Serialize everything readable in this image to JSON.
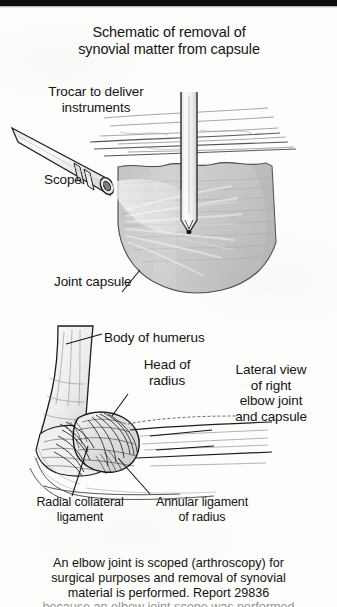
{
  "figure": {
    "title": "Schematic of removal of\nsynovial matter from capsule",
    "top_panel": {
      "labels": {
        "trocar": "Trocar to deliver\ninstruments",
        "scope": "Scope",
        "joint_capsule": "Joint capsule"
      }
    },
    "bottom_panel": {
      "labels": {
        "body_of_humerus": "Body of humerus",
        "head_of_radius": "Head of\nradius",
        "lateral_view": "Lateral view\nof right\nelbow joint\nand capsule",
        "radial_collateral_ligament": "Radial collateral\nligament",
        "annular_ligament": "Annular ligament\nof radius"
      }
    },
    "caption": "An elbow joint is scoped (arthroscopy) for\nsurgical purposes and removal of synovial\nmaterial is performed. Report 29836",
    "caption_cut_off": "because an elbow joint scope was performed"
  },
  "colors": {
    "ink": "#141414",
    "page_background": "#fdfdfc",
    "scan_bar": "#0e0e0e",
    "capsule_fill": "#c9c9c9",
    "capsule_shade": "#b4b4b4",
    "instrument_fill": "#f4f4f4",
    "instrument_outline": "#2a2a2a",
    "bone_outline": "#1c1c1c",
    "soft_tissue": "#8c8c8c"
  }
}
